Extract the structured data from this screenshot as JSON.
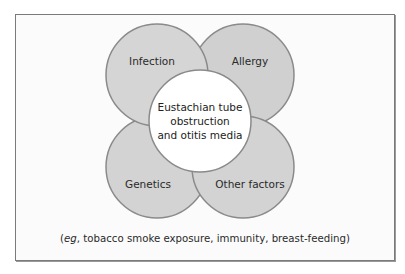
{
  "diagram": {
    "center": {
      "label_lines": [
        "Eustachian tube",
        "obstruction",
        "and otitis media"
      ]
    },
    "factors": [
      {
        "id": "infection",
        "label": "Infection"
      },
      {
        "id": "allergy",
        "label": "Allergy"
      },
      {
        "id": "genetics",
        "label": "Genetics"
      },
      {
        "id": "other",
        "label": "Other factors"
      }
    ],
    "caption": {
      "eg": "eg",
      "rest": ", tobacco smoke exposure, immunity, breast-feeding)",
      "open": "("
    },
    "colors": {
      "circle_fill": "#d3d3d3",
      "circle_stroke": "#8a8a8a",
      "center_fill": "#ffffff",
      "frame_border": "#7a7a7a"
    }
  }
}
